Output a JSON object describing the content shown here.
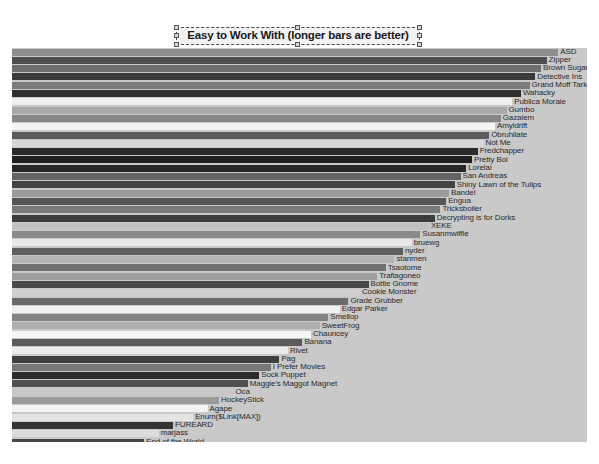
{
  "title": {
    "text": "Easy to Work With (longer bars are better)",
    "selected": true,
    "handle_count": 8
  },
  "canvas": {
    "background": "#ffffff",
    "plot_background": "#c9c9c9",
    "width": 599,
    "height": 464
  },
  "chart_data": {
    "type": "bar",
    "orientation": "horizontal",
    "title": "Easy to Work With (longer bars are better)",
    "subtitle": "",
    "xlabel": "",
    "ylabel": "",
    "grid": false,
    "legend": "none",
    "xlim": [
      0,
      100
    ],
    "note": "Grayscale horizontal bar chart; bars sorted descending. Values are percentages of plot width read off bar end positions.",
    "categories": [
      "ASD",
      "Zipper",
      "Brown Sugar",
      "Detective Ins",
      "Grand Moff Tark",
      "Wahacky",
      "Publica Morale",
      "Gumbo",
      "Gazalem",
      "Amyldrift",
      "Obruhilate",
      "Not Me",
      "Fredchapper",
      "Pretty Boi",
      "Lorelai",
      "San Andreas",
      "Shiny Lawn of the Tulips",
      "Bandel",
      "Engua",
      "Tricksboiler",
      "Decrypting is for Dorks",
      "XEKE",
      "Susanmwiffle",
      "bruewg",
      "nyder",
      "stanmen",
      "Tsaotome",
      "Traflagoneo",
      "Bottle Gnome",
      "Cookie Monster",
      "Grade Grubber",
      "Edgar Parker",
      "Smellop",
      "SweetFrog",
      "Chauncey",
      "Banana",
      "Rivet",
      "Pag",
      "I Prefer Movies",
      "Sock Puppet",
      "Maggie's Maggot Magnet",
      "Oca",
      "HockeyStick",
      "Agape",
      "Enum($Link[MAX])",
      "FUREARD",
      "marjass",
      "End of the World",
      "Jaguar",
      "BiGGirl",
      "Happy Bunny",
      "Ringo's kidneys",
      "Venus Fly Trap",
      "BNC"
    ],
    "values": [
      95.0,
      93.0,
      92.0,
      91.0,
      90.0,
      88.5,
      87.0,
      86.0,
      85.0,
      84.0,
      83.0,
      82.0,
      81.0,
      80.0,
      79.0,
      78.0,
      77.0,
      76.0,
      75.5,
      74.5,
      73.5,
      72.5,
      71.0,
      69.5,
      68.0,
      66.5,
      65.0,
      63.5,
      62.0,
      60.5,
      58.5,
      57.0,
      55.0,
      53.5,
      52.0,
      50.5,
      48.0,
      46.5,
      45.0,
      43.0,
      41.0,
      38.5,
      36.0,
      34.0,
      31.5,
      28.0,
      25.5,
      23.0,
      20.0,
      17.5,
      15.0,
      12.5,
      10.0,
      5.0
    ],
    "bar_colors": [
      "#8d8d8d",
      "#4e4e4e",
      "#6e6e6e",
      "#3a3a3a",
      "#7c7c7c",
      "#2e2e2e",
      "#efefef",
      "#a9a9a9",
      "#868686",
      "#f4f4f4",
      "#5c5c5c",
      "#d7d7d7",
      "#2a2a2a",
      "#1f1f1f",
      "#262626",
      "#636363",
      "#434343",
      "#9b9b9b",
      "#555555",
      "#7a7a7a",
      "#3c3c3c",
      "#c2c2c2",
      "#8a8a8a",
      "#e8e8e8",
      "#5f5f5f",
      "#b4b4b4",
      "#707070",
      "#9e9e9e",
      "#484848",
      "#d0d0d0",
      "#6a6a6a",
      "#f0f0f0",
      "#828282",
      "#aeaeae",
      "#f6f6f6",
      "#5a5a5a",
      "#ebebeb",
      "#3f3f3f",
      "#777777",
      "#2b2b2b",
      "#505050",
      "#c8c8c8",
      "#9a9a9a",
      "#f2f2f2",
      "#e4e4e4",
      "#343434",
      "#dcdcdc",
      "#474747",
      "#a2a2a2",
      "#3d3d3d",
      "#fafafa",
      "#f8f8f8",
      "#454545",
      "#bcbcbc"
    ]
  }
}
